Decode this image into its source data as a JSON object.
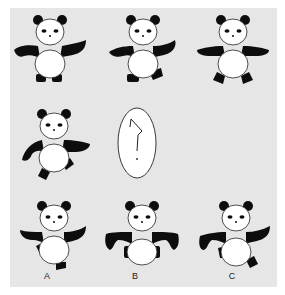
{
  "puzzle": {
    "type": "figure-sequence-reasoning",
    "grid": {
      "rows": [
        [
          "panda-arms-down-both-feet-down",
          "panda-arms-out-right-foot-raised",
          "panda-arms-straight-both-feet-out"
        ],
        [
          "panda-left-arm-down-right-arm-out-right-foot-kick",
          "question-mark",
          null
        ]
      ]
    },
    "question_mark": "?",
    "options": [
      {
        "label": "A",
        "pose": "panda-arms-out-left-foot-up-right-foot-down"
      },
      {
        "label": "B",
        "pose": "panda-arms-down-hunched-both-feet-in"
      },
      {
        "label": "C",
        "pose": "panda-arms-out-left-foot-in-right-foot-raised"
      }
    ]
  },
  "colors": {
    "panel_background": "#e6e6e6",
    "panda_black": "#0d0d0d",
    "panda_white": "#ffffff"
  }
}
